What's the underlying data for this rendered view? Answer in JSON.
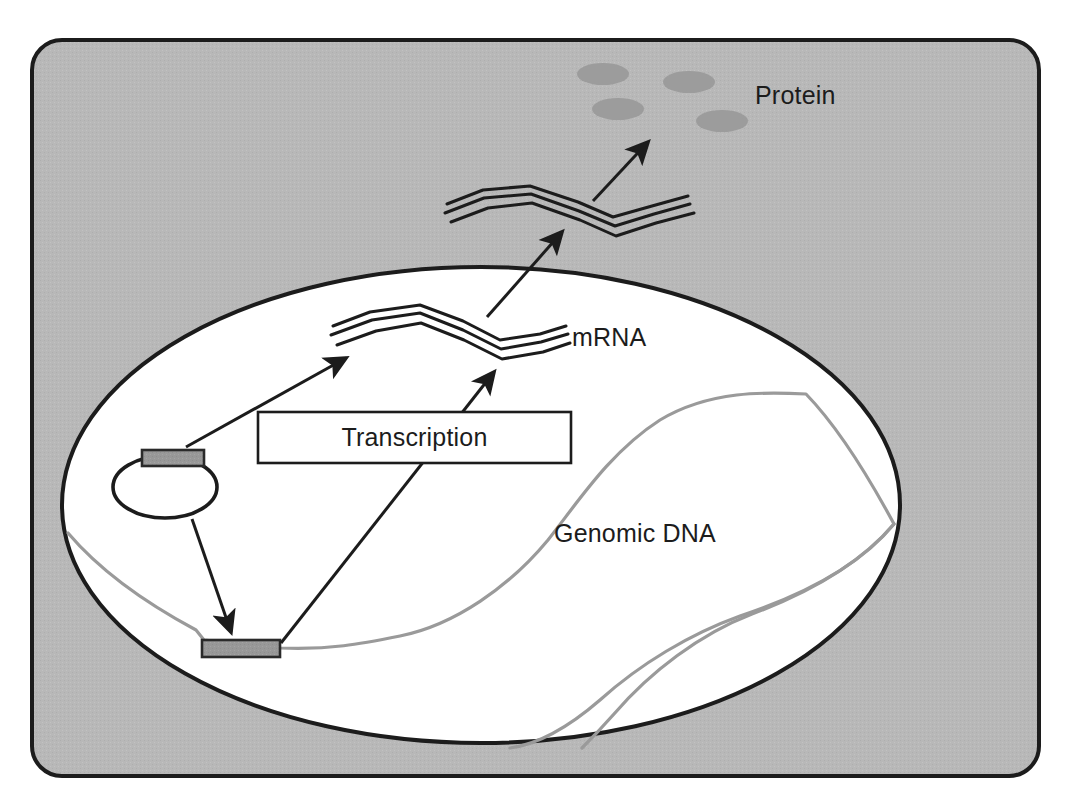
{
  "figure": {
    "labels": {
      "protein": "Protein",
      "mrna": "mRNA",
      "genomic_dna": "Genomic DNA",
      "transcription": "Transcription"
    },
    "colors": {
      "cytoplasm_fill": "#b8b8b8",
      "nucleus_fill": "#ffffff",
      "outline": "#1c1c1c",
      "gene_box_fill": "#848484",
      "protein_fill": "#9c9c9c",
      "dna_strand": "#9a9a9a",
      "page_background": "#ffffff"
    },
    "structures": {
      "cell_membrane": "rounded-rectangle",
      "nucleus": "ellipse",
      "plasmid": "ellipse",
      "gene_boxes": 2,
      "protein_blobs": 4,
      "mrna_strands": 2,
      "arrows": 4
    }
  }
}
